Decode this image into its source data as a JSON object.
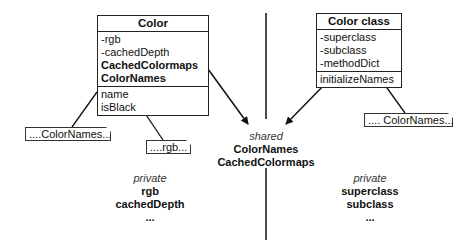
{
  "color_box": {
    "title": "Color",
    "attributes": [
      {
        "text": "-rgb",
        "bold": false
      },
      {
        "text": "-cachedDepth",
        "bold": false
      },
      {
        "text": "CachedColormaps",
        "bold": true
      },
      {
        "text": "ColorNames",
        "bold": true
      }
    ],
    "methods": [
      "name",
      "isBlack"
    ]
  },
  "color_class_box": {
    "title": "Color class",
    "attributes": [
      "-superclass",
      "-subclass",
      "-methodDict"
    ],
    "methods": [
      "initializeNames"
    ]
  },
  "notes": {
    "left_colornames": "....ColorNames...",
    "rgb": "....rgb...",
    "right_colornames": ".... ColorNames..."
  },
  "shared": {
    "caption": "shared",
    "values": [
      "ColorNames",
      "CachedColormaps"
    ]
  },
  "private_left": {
    "caption": "private",
    "values": [
      "rgb",
      "cachedDepth",
      "..."
    ]
  },
  "private_right": {
    "caption": "private",
    "values": [
      "superclass",
      "subclass",
      "..."
    ]
  }
}
